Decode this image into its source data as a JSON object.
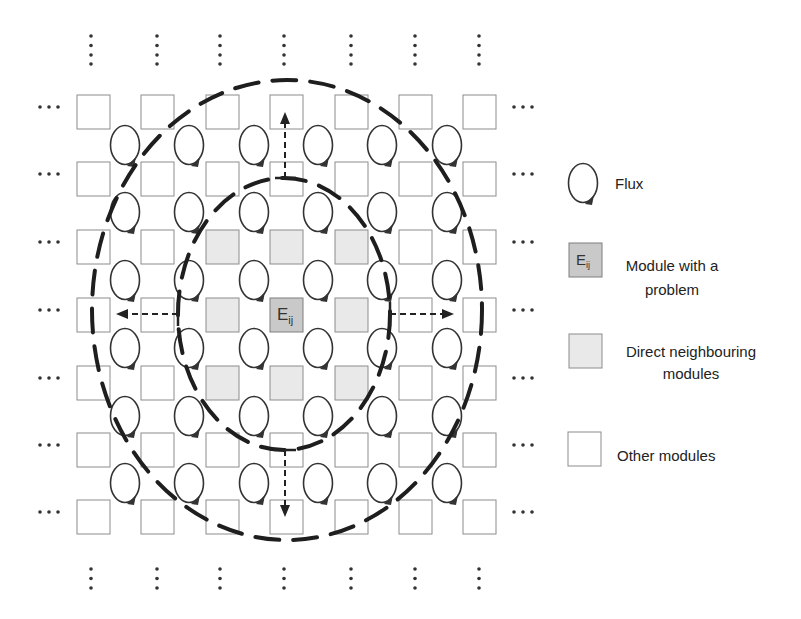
{
  "diagram": {
    "center_module_label": "E",
    "center_module_subscript": "ij",
    "grid": {
      "rows": 7,
      "cols": 7,
      "problem_module": [
        3,
        3
      ],
      "direct_neighbours": [
        [
          2,
          2
        ],
        [
          2,
          3
        ],
        [
          2,
          4
        ],
        [
          3,
          2
        ],
        [
          3,
          4
        ],
        [
          4,
          2
        ],
        [
          4,
          3
        ],
        [
          4,
          4
        ]
      ]
    },
    "continuation_symbol": "…",
    "colors": {
      "other_module_fill": "#ffffff",
      "neighbour_module_fill": "#e9e9e9",
      "problem_module_fill": "#c9c9c9",
      "module_border": "#8c8c8c",
      "line": "#222222"
    }
  },
  "legend": {
    "items": [
      {
        "icon": "flux-icon",
        "label": "Flux"
      },
      {
        "icon": "problem-module-icon",
        "icon_label": "E",
        "icon_sub": "ij",
        "label_line1": "Module with a",
        "label_line2": "problem"
      },
      {
        "icon": "neighbour-module-icon",
        "label_line1": "Direct neighbouring",
        "label_line2": "modules"
      },
      {
        "icon": "other-module-icon",
        "label": "Other modules"
      }
    ]
  }
}
